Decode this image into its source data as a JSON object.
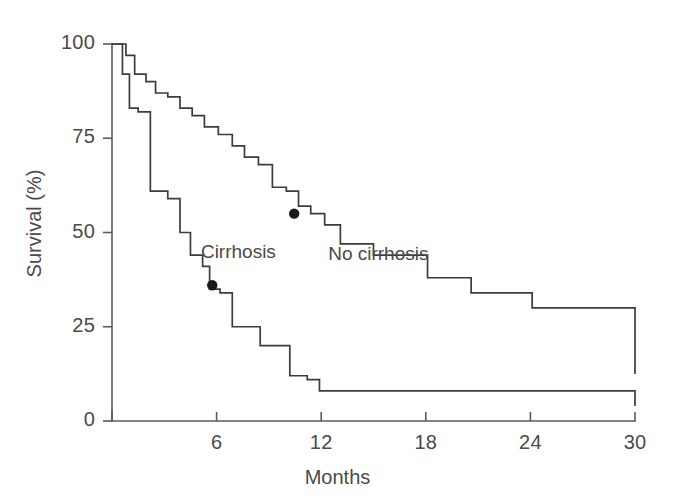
{
  "chart_data": {
    "type": "line",
    "subtype": "kaplan-meier-step",
    "title": "",
    "xlabel": "Months",
    "ylabel": "Survival (%)",
    "xlim": [
      0,
      30
    ],
    "ylim": [
      0,
      100
    ],
    "xticks": [
      6,
      12,
      18,
      24,
      30
    ],
    "yticks": [
      0,
      25,
      50,
      75,
      100
    ],
    "xtick_labels": [
      "6",
      "12",
      "18",
      "24",
      "30"
    ],
    "ytick_labels": [
      "0",
      "25",
      "50",
      "75",
      "100"
    ],
    "grid": false,
    "legend_position": "inline-annotation",
    "line_color": "#3c3c3c",
    "axis_color": "#5a5a5a",
    "marker_color": "#1a1a1a",
    "background": "#ffffff",
    "series": [
      {
        "name": "No cirrhosis",
        "label": "No cirrhosis",
        "label_x_months": 12.4,
        "label_y_percent": 44,
        "steps_x": [
          0.35,
          0.8,
          1.3,
          1.95,
          2.5,
          3.2,
          3.9,
          4.6,
          5.3,
          6.1,
          6.9,
          7.6,
          8.4,
          9.2,
          10.0,
          10.7,
          11.4,
          12.2,
          13.1,
          15.0,
          18.1,
          20.6,
          24.1,
          30.0
        ],
        "steps_y": [
          100,
          97,
          92,
          90,
          87,
          86,
          83,
          81,
          78,
          76,
          73,
          70,
          68,
          62,
          61,
          57,
          55,
          52,
          47,
          44,
          38,
          34,
          30,
          12.5
        ],
        "start_y": 100,
        "end_y": 12.5
      },
      {
        "name": "Cirrhosis",
        "label": "Cirrhosis",
        "label_x_months": 5.1,
        "label_y_percent": 44.5,
        "steps_x": [
          0.35,
          0.6,
          1.0,
          1.5,
          2.2,
          3.2,
          3.9,
          4.5,
          5.2,
          5.6,
          6.2,
          6.9,
          8.5,
          10.2,
          11.2,
          11.9,
          30.0
        ],
        "steps_y": [
          100,
          92,
          83,
          82,
          61,
          59,
          50,
          44,
          41,
          35,
          34,
          25,
          20,
          12,
          11,
          8,
          4
        ],
        "start_y": 100,
        "end_y": 4
      }
    ],
    "markers": [
      {
        "label": "median-cirrhosis",
        "x_months": 5.75,
        "y_percent": 36,
        "series": "Cirrhosis"
      },
      {
        "label": "median-no-cirrhosis",
        "x_months": 10.45,
        "y_percent": 55,
        "series": "No cirrhosis"
      }
    ]
  },
  "axes": {
    "y_title": "Survival (%)",
    "x_title": "Months"
  },
  "annotations": {
    "cirrhosis_label": "Cirrhosis",
    "no_cirrhosis_label": "No cirrhosis"
  }
}
